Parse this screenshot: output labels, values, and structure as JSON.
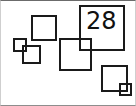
{
  "figure": {
    "width": 136,
    "height": 106,
    "background_color": "#ffffff",
    "frame": {
      "visible": true,
      "color": "#6b6b6b"
    },
    "label_count": 1
  },
  "labels": [
    {
      "text": "28",
      "x": 86,
      "y": 9,
      "font_size": 24,
      "color": "#111111"
    }
  ],
  "shapes": [
    {
      "name": "square-tiny-left",
      "x": 13,
      "y": 38,
      "size": 14,
      "stroke": "#1a1a1a",
      "stroke_width": 2
    },
    {
      "name": "square-small-left",
      "x": 22,
      "y": 45,
      "size": 19,
      "stroke": "#1a1a1a",
      "stroke_width": 2
    },
    {
      "name": "square-upper-left",
      "x": 31,
      "y": 15,
      "size": 26,
      "stroke": "#1a1a1a",
      "stroke_width": 2
    },
    {
      "name": "square-center",
      "x": 59,
      "y": 38,
      "size": 33,
      "stroke": "#1a1a1a",
      "stroke_width": 2
    },
    {
      "name": "square-labeled-28",
      "x": 79,
      "y": 5,
      "size": 46,
      "stroke": "#1a1a1a",
      "stroke_width": 2
    },
    {
      "name": "square-lower-right",
      "x": 101,
      "y": 65,
      "size": 27,
      "stroke": "#1a1a1a",
      "stroke_width": 2
    },
    {
      "name": "square-tiny-bottom-right",
      "x": 119,
      "y": 83,
      "size": 13,
      "stroke": "#1a1a1a",
      "stroke_width": 2
    }
  ]
}
